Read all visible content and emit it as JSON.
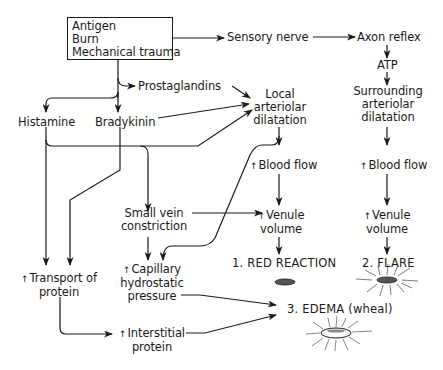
{
  "diagram": {
    "up_arrow_glyph": "↑",
    "stimulus_box": {
      "lines": [
        "Antigen",
        "Burn",
        "Mechanical trauma"
      ]
    },
    "nodes": {
      "sensory_nerve": "Sensory nerve",
      "axon_reflex": "Axon reflex",
      "atp": "ATP",
      "surrounding_dilatation": [
        "Surrounding",
        "arteriolar",
        "dilatation"
      ],
      "prostaglandins": "Prostaglandins",
      "histamine": "Histamine",
      "bradykinin": "Bradykinin",
      "local_dilatation": [
        "Local",
        "arteriolar",
        "dilatation"
      ],
      "blood_flow_local": "Blood flow",
      "blood_flow_surrounding": "Blood flow",
      "small_vein": [
        "Small vein",
        "constriction"
      ],
      "venule_volume_local": [
        "Venule",
        "volume"
      ],
      "venule_volume_surrounding": [
        "Venule",
        "volume"
      ],
      "transport_protein": [
        "Transport of",
        "protein"
      ],
      "capillary_pressure": [
        "Capillary",
        "hydrostatic",
        "pressure"
      ],
      "interstitial_protein": [
        "Interstitial",
        "protein"
      ]
    },
    "outcomes": {
      "red_reaction": "1. RED REACTION",
      "flare": "2. FLARE",
      "edema": "3. EDEMA (wheal)"
    },
    "colors": {
      "ink": "#1a1a1a",
      "background": "#ffffff",
      "lesion_fill": "#555555"
    }
  }
}
